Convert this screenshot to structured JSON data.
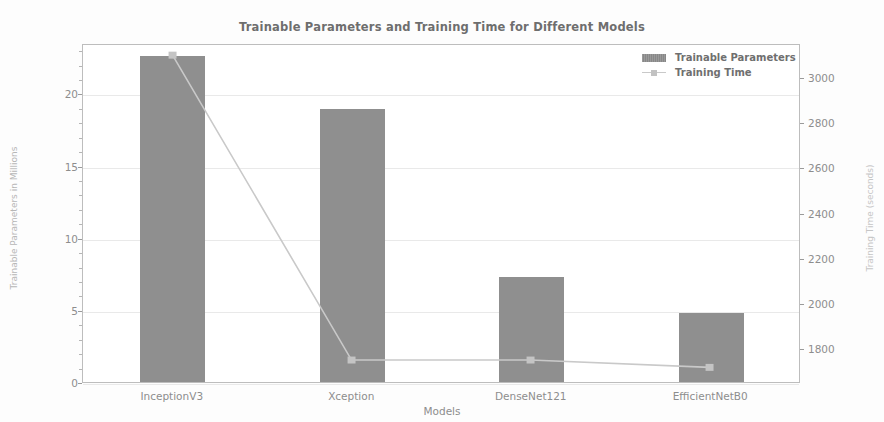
{
  "chart_data": {
    "type": "bar",
    "title": "Trainable Parameters and Training Time for Different Models",
    "xlabel": "Models",
    "ylabel": "Trainable Parameters in Millions",
    "ylabel_right": "Training Time (seconds)",
    "categories": [
      "InceptionV3",
      "Xception",
      "DenseNet121",
      "EfficientNetB0"
    ],
    "ylim": [
      0,
      23.5
    ],
    "ylim_right": [
      1650,
      3150
    ],
    "yticks": [
      "0",
      "5",
      "10",
      "15",
      "20"
    ],
    "ytick_values": [
      0,
      5,
      10,
      15,
      20
    ],
    "yticks_right": [
      "1800",
      "2000",
      "2200",
      "2400",
      "2600",
      "2800",
      "3000"
    ],
    "ytick_values_right": [
      1800,
      2000,
      2200,
      2400,
      2600,
      2800,
      3000
    ],
    "grid": true,
    "legend_position": "upper right",
    "series": [
      {
        "name": "Trainable Parameters",
        "kind": "bar",
        "axis": "left",
        "color": "#8f8f8f",
        "values": [
          22.6,
          18.9,
          7.3,
          4.8
        ]
      },
      {
        "name": "Training Time",
        "kind": "line",
        "axis": "right",
        "color": "#c9c9c9",
        "values": [
          3105,
          1748,
          1748,
          1715
        ]
      }
    ]
  },
  "legend": {
    "items": [
      {
        "label": "Trainable Parameters",
        "type": "bar"
      },
      {
        "label": "Training Time",
        "type": "line"
      }
    ]
  }
}
